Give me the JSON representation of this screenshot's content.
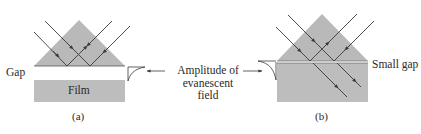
{
  "figure": {
    "colors": {
      "prism_fill": "#b9b9b9",
      "film_fill": "#bdbdbd",
      "ray": "#3a3a3a",
      "background": "#ffffff"
    },
    "panel_a": {
      "caption": "(a)",
      "gap_label": "Gap",
      "film_label": "Film"
    },
    "panel_b": {
      "caption": "(b)",
      "gap_label": "Small gap"
    },
    "shared_label": {
      "line1": "Amplitude of",
      "line2": "evanescent",
      "line3": "field"
    }
  }
}
